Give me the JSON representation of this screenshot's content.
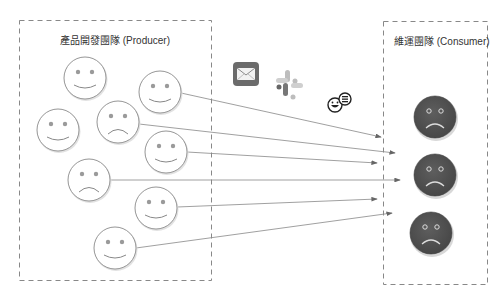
{
  "producer": {
    "title": "產品開發團隊 (Producer)",
    "faces": [
      {
        "cx": 85,
        "cy": 78,
        "mood": "happy"
      },
      {
        "cx": 160,
        "cy": 92,
        "mood": "happy"
      },
      {
        "cx": 58,
        "cy": 130,
        "mood": "happy"
      },
      {
        "cx": 118,
        "cy": 122,
        "mood": "sad"
      },
      {
        "cx": 166,
        "cy": 152,
        "mood": "happy"
      },
      {
        "cx": 89,
        "cy": 180,
        "mood": "sad"
      },
      {
        "cx": 156,
        "cy": 208,
        "mood": "happy"
      },
      {
        "cx": 115,
        "cy": 248,
        "mood": "happy"
      }
    ]
  },
  "consumer": {
    "title": "維運團隊 (Consumer)",
    "faces": [
      {
        "cx": 435,
        "cy": 117,
        "mood": "sad"
      },
      {
        "cx": 435,
        "cy": 175,
        "mood": "sad"
      },
      {
        "cx": 431,
        "cy": 233,
        "mood": "sad"
      }
    ]
  },
  "channels": [
    "mail-icon",
    "slack-icon",
    "chat-bot-icon"
  ],
  "colors": {
    "border": "#888888",
    "arrow": "#777777",
    "consumer_face": "#555555",
    "producer_face": "#ffffff"
  },
  "caption": ""
}
